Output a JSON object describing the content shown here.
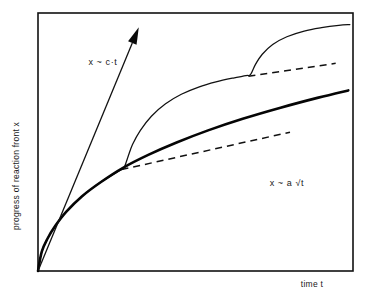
{
  "figure": {
    "background_color": "#ffffff",
    "line_color": "#111111",
    "axes": {
      "ylabel": "progress of reaction front x",
      "xlabel": "time t",
      "frame": {
        "left": 38,
        "top": 13,
        "right": 353,
        "bottom": 271
      },
      "grid": false,
      "ticks": false
    },
    "annotations": {
      "linear_label": "x ~ c·t",
      "sqrt_label": "x ~ a √t"
    }
  },
  "chart_data": {
    "type": "line",
    "title": "",
    "subtitle": "",
    "xlabel": "time t",
    "ylabel": "progress of reaction front x",
    "xlim": [
      0,
      1
    ],
    "ylim": [
      0,
      1
    ],
    "grid": false,
    "legend": "none",
    "axis_ticks": "none",
    "series": [
      {
        "name": "x ~ a √t (parabolic law)",
        "style": "solid-thick",
        "label": "x ~ a √t",
        "label_position": {
          "x": 0.79,
          "y": 0.33
        },
        "points": [
          [
            0.0,
            0.0
          ],
          [
            0.012,
            0.075
          ],
          [
            0.03,
            0.125
          ],
          [
            0.055,
            0.175
          ],
          [
            0.09,
            0.23
          ],
          [
            0.14,
            0.29
          ],
          [
            0.2,
            0.345
          ],
          [
            0.27,
            0.4
          ],
          [
            0.35,
            0.45
          ],
          [
            0.44,
            0.498
          ],
          [
            0.54,
            0.545
          ],
          [
            0.65,
            0.59
          ],
          [
            0.77,
            0.633
          ],
          [
            0.89,
            0.672
          ],
          [
            0.985,
            0.7
          ]
        ]
      },
      {
        "name": "stepped breakaway curve",
        "style": "solid-thin",
        "points": [
          [
            0.0,
            0.0
          ],
          [
            0.012,
            0.075
          ],
          [
            0.03,
            0.125
          ],
          [
            0.055,
            0.175
          ],
          [
            0.09,
            0.23
          ],
          [
            0.14,
            0.29
          ],
          [
            0.2,
            0.345
          ],
          [
            0.26,
            0.39
          ],
          [
            0.273,
            0.4
          ],
          [
            0.285,
            0.44
          ],
          [
            0.3,
            0.49
          ],
          [
            0.325,
            0.545
          ],
          [
            0.36,
            0.6
          ],
          [
            0.405,
            0.648
          ],
          [
            0.455,
            0.685
          ],
          [
            0.51,
            0.713
          ],
          [
            0.565,
            0.733
          ],
          [
            0.62,
            0.748
          ],
          [
            0.66,
            0.757
          ],
          [
            0.675,
            0.762
          ],
          [
            0.69,
            0.8
          ],
          [
            0.712,
            0.84
          ],
          [
            0.745,
            0.878
          ],
          [
            0.79,
            0.908
          ],
          [
            0.845,
            0.93
          ],
          [
            0.9,
            0.943
          ],
          [
            0.955,
            0.952
          ],
          [
            0.99,
            0.955
          ]
        ]
      },
      {
        "name": "lower dashed asymptote",
        "style": "dashed",
        "points": [
          [
            0.265,
            0.393
          ],
          [
            0.8,
            0.538
          ]
        ]
      },
      {
        "name": "upper dashed asymptote",
        "style": "dashed",
        "points": [
          [
            0.668,
            0.755
          ],
          [
            0.945,
            0.805
          ]
        ]
      },
      {
        "name": "x ~ c·t (linear law)",
        "style": "arrow",
        "label": "x ~ c·t",
        "label_position": {
          "x": 0.16,
          "y": 0.8
        },
        "points": [
          [
            0.0,
            0.0
          ],
          [
            0.32,
            0.945
          ]
        ]
      }
    ]
  }
}
